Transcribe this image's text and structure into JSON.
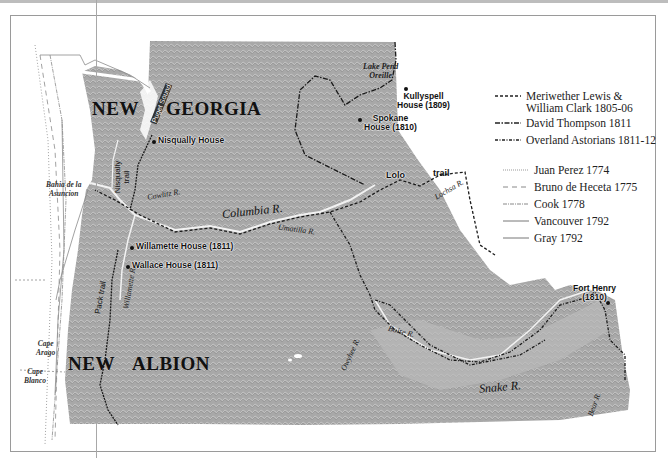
{
  "regions": {
    "north_name_1": "NEW",
    "north_name_2": "GEORGIA",
    "south_name_1": "NEW",
    "south_name_2": "ALBION"
  },
  "places": {
    "nisqually": "Nisqually House",
    "kullyspell_1": "Kullyspell",
    "kullyspell_2": "House (1809)",
    "spokane_1": "Spokane",
    "spokane_2": "House (1810)",
    "willamette": "Willamette House (1811)",
    "wallace": "Wallace House (1811)",
    "fort_henry_1": "Fort Henry",
    "fort_henry_2": "(1810)",
    "lolo": "Lolo"
  },
  "water": {
    "lake_1": "Lake Pend",
    "lake_2": "Oreille",
    "columbia": "Columbia R.",
    "cowlitz": "Cowlitz R.",
    "umatilla": "Umatilla R.",
    "lochsa": "Lochsa R.",
    "willamette": "Willamette R.",
    "boise": "Boise R.",
    "snake": "Snake R.",
    "owyhee": "Owyhee R.",
    "bear": "Bear R.",
    "puget": "Puget Sound"
  },
  "coast": {
    "bahia_1": "Bahia de la",
    "bahia_2": "Asuncion",
    "arago_1": "Cape",
    "arago_2": "Arago",
    "blanco_1": "Cape",
    "blanco_2": "Blanco"
  },
  "trails": {
    "nisqually_1": "Nisqually",
    "nisqually_2": "trail",
    "pack": "Pack trail",
    "lolo_trail": "trail"
  },
  "legend": {
    "items": [
      {
        "label": "Meriwether Lewis &",
        "label2": "William Clark  1805-06",
        "style": "dashed"
      },
      {
        "label": "David Thompson 1811",
        "style": "dashdot"
      },
      {
        "label": "Overland Astorians 1811-12",
        "style": "dashdotdot"
      },
      {
        "label": "Juan Perez 1774",
        "style": "dotted"
      },
      {
        "label": "Bruno de Heceta 1775",
        "style": "longdash"
      },
      {
        "label": "Cook  1778",
        "style": "dotdash"
      },
      {
        "label": "Vancouver  1792",
        "style": "solid"
      },
      {
        "label": "Gray 1792",
        "style": "solid"
      }
    ]
  },
  "colors": {
    "land": "#a9a9a9",
    "route": "#1a1a1a",
    "explorer": "#8a8a8a"
  }
}
